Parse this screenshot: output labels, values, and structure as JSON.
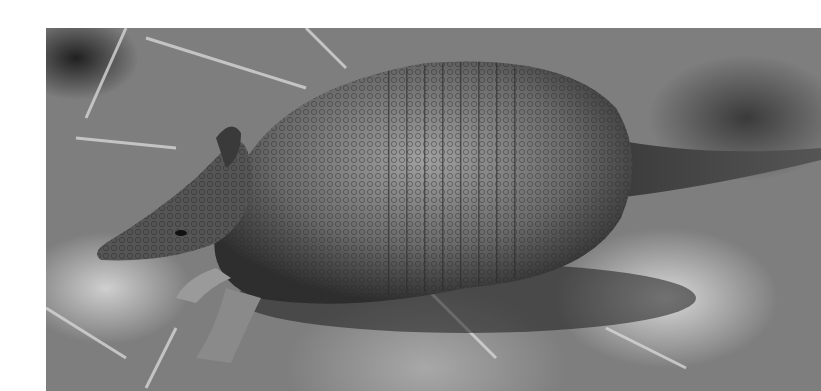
{
  "image": {
    "subject": "armadillo",
    "style": "black-and-white photograph",
    "colors": {
      "background": "#ffffff",
      "ground": "#7e7e7e",
      "shell_dark": "#3c3c3c",
      "shell_light": "#9a9a9a"
    }
  }
}
